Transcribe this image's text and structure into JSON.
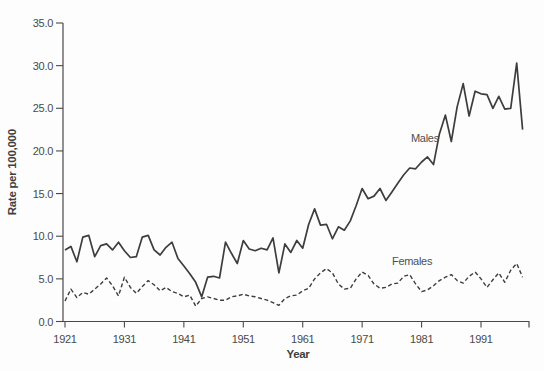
{
  "chart_data": {
    "type": "line",
    "title": "",
    "xlabel": "Year",
    "ylabel": "Rate per 100,000",
    "grid": false,
    "legend_position": "inline-annotations",
    "xlim": [
      1921,
      1999
    ],
    "ylim": [
      0,
      35
    ],
    "xticks": [
      1921,
      1931,
      1941,
      1951,
      1961,
      1971,
      1981,
      1991
    ],
    "yticks": [
      0,
      5,
      10,
      15,
      20,
      25,
      30,
      35
    ],
    "ytick_labels": [
      "0.0",
      "5.0",
      "10.0",
      "15.0",
      "20.0",
      "25.0",
      "30.0",
      "35.0"
    ],
    "line_color": "#3d3d3d",
    "x": [
      1921,
      1922,
      1923,
      1924,
      1925,
      1926,
      1927,
      1928,
      1929,
      1930,
      1931,
      1932,
      1933,
      1934,
      1935,
      1936,
      1937,
      1938,
      1939,
      1940,
      1941,
      1942,
      1943,
      1944,
      1945,
      1946,
      1947,
      1948,
      1949,
      1950,
      1951,
      1952,
      1953,
      1954,
      1955,
      1956,
      1957,
      1958,
      1959,
      1960,
      1961,
      1962,
      1963,
      1964,
      1965,
      1966,
      1967,
      1968,
      1969,
      1970,
      1971,
      1972,
      1973,
      1974,
      1975,
      1976,
      1977,
      1978,
      1979,
      1980,
      1981,
      1982,
      1983,
      1984,
      1985,
      1986,
      1987,
      1988,
      1989,
      1990,
      1991,
      1992,
      1993,
      1994,
      1995,
      1996,
      1997,
      1998
    ],
    "series": [
      {
        "name": "Males",
        "style": "solid",
        "label_anchor": {
          "x": 411,
          "y": 142
        },
        "values": [
          8.4,
          8.8,
          7.0,
          9.9,
          10.1,
          7.6,
          8.9,
          9.1,
          8.4,
          9.3,
          8.3,
          7.5,
          7.6,
          9.9,
          10.1,
          8.4,
          7.8,
          8.7,
          9.3,
          7.4,
          6.5,
          5.6,
          4.6,
          2.9,
          5.2,
          5.3,
          5.1,
          9.3,
          8.0,
          6.8,
          9.5,
          8.5,
          8.3,
          8.6,
          8.4,
          9.8,
          5.7,
          9.1,
          8.1,
          9.5,
          8.6,
          11.4,
          13.2,
          11.3,
          11.4,
          9.7,
          11.1,
          10.7,
          11.8,
          13.6,
          15.6,
          14.4,
          14.7,
          15.6,
          14.2,
          15.2,
          16.2,
          17.2,
          18.0,
          17.9,
          18.7,
          19.3,
          18.4,
          22.0,
          24.2,
          21.1,
          25.2,
          27.9,
          24.1,
          27.0,
          26.7,
          26.6,
          25.0,
          26.4,
          24.9,
          25.0,
          30.3,
          22.5
        ]
      },
      {
        "name": "Females",
        "style": "dashed",
        "label_anchor": {
          "x": 392,
          "y": 265
        },
        "values": [
          2.4,
          3.8,
          2.8,
          3.4,
          3.2,
          3.8,
          4.4,
          5.1,
          4.2,
          3.0,
          5.2,
          4.0,
          3.3,
          4.1,
          4.8,
          4.3,
          3.6,
          4.0,
          3.5,
          3.3,
          2.9,
          3.1,
          1.8,
          2.7,
          2.9,
          2.7,
          2.5,
          2.5,
          2.9,
          3.0,
          3.2,
          3.0,
          2.9,
          2.7,
          2.5,
          2.2,
          1.9,
          2.7,
          3.0,
          3.1,
          3.6,
          3.9,
          5.0,
          5.7,
          6.2,
          5.7,
          4.4,
          3.8,
          3.9,
          5.0,
          5.8,
          5.4,
          4.4,
          3.9,
          4.0,
          4.4,
          4.5,
          5.3,
          5.5,
          4.4,
          3.5,
          3.7,
          4.2,
          4.8,
          5.2,
          5.5,
          4.8,
          4.5,
          5.3,
          5.8,
          5.0,
          4.0,
          4.9,
          5.7,
          4.6,
          6.0,
          6.8,
          5.2
        ]
      }
    ]
  }
}
